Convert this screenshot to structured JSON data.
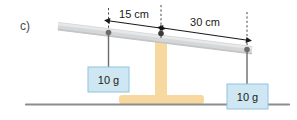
{
  "figure": {
    "part_label": "c)",
    "title_visible": false
  },
  "colors": {
    "beam": "#d5d7d8",
    "beam_edge": "#c3c5c6",
    "stand": "#f7d9a0",
    "ground": "#8c8c8c",
    "mass_box_fill": "#cfe7f2",
    "mass_box_stroke": "#8fc5dd",
    "dimension_line": "#1a1a1a",
    "dashed_line": "#4a4a4a",
    "hanger_line": "#6b6b6b",
    "pivot_dot": "#6b6b6b",
    "text": "#1a1a1a",
    "part_label_text": "#4a4a4a"
  },
  "dimensions": [
    {
      "name": "left-arm",
      "label": "15 cm",
      "value": 15,
      "unit": "cm",
      "from": "left-hanger",
      "to": "fulcrum"
    },
    {
      "name": "right-arm",
      "label": "30 cm",
      "value": 30,
      "unit": "cm",
      "from": "fulcrum",
      "to": "right-hanger"
    }
  ],
  "masses": [
    {
      "name": "left-mass",
      "label": "10 g",
      "value": 10,
      "unit": "g",
      "side": "left"
    },
    {
      "name": "right-mass",
      "label": "10 g",
      "value": 10,
      "unit": "g",
      "side": "right"
    }
  ],
  "scene": {
    "beam_tilt": "down-to-the-right",
    "fulcrum": "central T-shaped stand",
    "ground": "horizontal ground line"
  }
}
